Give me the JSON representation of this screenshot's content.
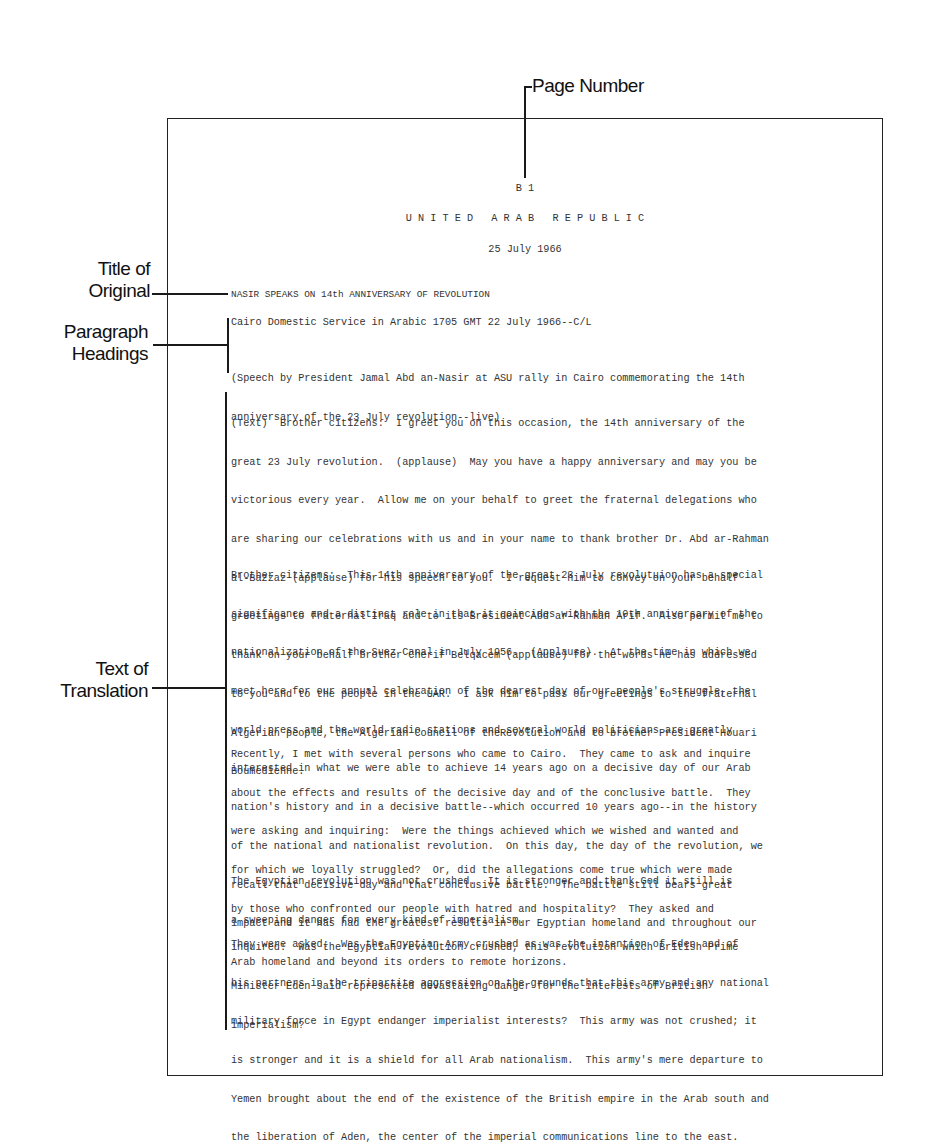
{
  "annotations": {
    "page_number": "Page Number",
    "title_of_original": [
      "Title of",
      "Original"
    ],
    "paragraph_headings": [
      "Paragraph",
      "Headings"
    ],
    "text_of_translation": [
      "Text of",
      "Translation"
    ]
  },
  "document": {
    "page_number": "B 1",
    "country": "U N I T E D   A R A B   R E P U B L I C",
    "date": "25 July 1966",
    "title": "NASIR SPEAKS ON 14th ANNIVERSARY OF REVOLUTION",
    "heading_source": "Cairo Domestic Service in Arabic 1705 GMT 22 July 1966--C/L",
    "heading_note": [
      "(Speech by President Jamal Abd an-Nasir at ASU rally in Cairo commemorating the 14th",
      "anniversary of the 23 July revolution--live)"
    ],
    "paragraphs": [
      [
        "(Text)  Brother citizens:  I greet you on this occasion, the 14th anniversary of the",
        "great 23 July revolution.  (applause)  May you have a happy anniversary and may you be",
        "victorious every year.  Allow me on your behalf to greet the fraternal delegations who",
        "are sharing our celebrations with us and in your name to thank brother Dr. Abd ar-Rahman",
        "al-Bazzaz (applause) for his speech to you.  I request him to convey on your behalf",
        "greetings to fraternal Iraq and to its Bresident Abd ar-Rahman Arif.  Also permit me to",
        "thank on your behalf brother Cherif Belqacem (applause) for the words he has addressed",
        "to you and to the people in the UAR.  I ask him to pass our greetings to the fraternal",
        "Algerian people, the Algerian Council of theRevolution and to brother President Houari",
        "Boumedienne."
      ],
      [
        "Brother citizens:  This 14th anniversary of the great 23 July revolutuion has a special",
        "significance and a distinct role in that it coincides with the 10th anniversary of the",
        "nationalization of the Suez Canal in July 1956.  (Applause).  At the time in which we",
        "meet here for our annual celebration of the dearest day of our people's struggle, the",
        "world press and the world radio stations and several world politicians are greatly",
        "interested in what we were able to achieve 14 years ago on a decisive day of our Arab",
        "nation's history and in a decisive battle--which occurred 10 years ago--in the history",
        "of the national and nationalist revolution.  On this day, the day of the revolution, we",
        "recall that decisive day and that conclusive battle.  The battle still bears great",
        "impact and it has had the greatest results in our Egyptian homeland and throughout our",
        "Arab homeland and beyond its orders to remote horizons."
      ],
      [
        "Recently, I met with several persons who came to Cairo.  They came to ask and inquire",
        "about the effects and results of the decisive day and of the conclusive battle.  They",
        "were asking and inquiring:  Were the things achieved which we wished and wanted and",
        "for which we loyally struggled?  Or, did the allegations come true which were made",
        "by those who confronted our people with hatred and hospitality?  They asked and",
        "inquired:  Was the Egyptian revolution crushed, this revolution which British Prime",
        "Minister Eden said represented devastating danger for the interests of British",
        "imperialism?"
      ],
      [
        "The Egyptian revolution was not crushed.  It is stronger and thank God it still is",
        "a sweeping danger for every kind of imperialism."
      ],
      [
        "They were asked:  Was the Egyptian Army crushed as was the intention of Eden and of",
        "his partners in the tripartite aggression on the grounds that this army and any national",
        "military force in Egypt endanger imperialist interests?  This army was not crushed; it",
        "is stronger and it is a shield for all Arab nationalism.  This army's mere departure to",
        "Yemen brought about the end of the existence of the British empire in the Arab south and",
        "the liberation of Aden, the center of the imperial communications line to the east."
      ]
    ]
  }
}
